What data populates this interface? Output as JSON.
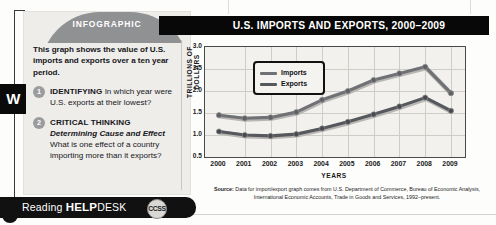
{
  "left_tab": {
    "label": "W"
  },
  "card": {
    "banner": "INFOGRAPHIC",
    "lede": "This graph shows the value of U.S. imports and exports over a ten year period.",
    "questions": [
      {
        "number": "1",
        "term": "IDENTIFYING",
        "text": "In which year were U.S. exports at their lowest?"
      },
      {
        "number": "2",
        "term": "CRITICAL THINKING",
        "subterm": "Determining Cause and Effect",
        "text": "What is one effect of a country importing more than it exports?"
      }
    ]
  },
  "title_bar": {
    "title": "U.S. IMPORTS AND EXPORTS, 2000–2009"
  },
  "source": {
    "label": "Source:",
    "text": "Data for import/export graph comes from U.S. Department of Commerce, Bureau of Economic Analysis, International Economic Accounts, Trade in Goods and Services, 1992–present."
  },
  "help_desk": {
    "word1": "Reading",
    "word2": "HELP",
    "word3": "DESK",
    "badge": "CCSS"
  },
  "colors": {
    "imports_line": "#6f7174",
    "exports_line": "#55585c",
    "title_bar": "#080808",
    "card_bg": "#eeedea",
    "hump": "#8f9193",
    "plot_bg": "#f2f1ee",
    "grid": "#cfcdc8"
  },
  "chart_data": {
    "type": "line",
    "title": "U.S. IMPORTS AND EXPORTS, 2000–2009",
    "xlabel": "YEARS",
    "ylabel": "TRILLIONS OF DOLLARS",
    "categories": [
      "2000",
      "2001",
      "2002",
      "2003",
      "2004",
      "2005",
      "2006",
      "2007",
      "2008",
      "2009"
    ],
    "ylim": [
      0.5,
      3.0
    ],
    "yticks": [
      "3.0",
      "2.5",
      "2.0",
      "1.5",
      "1.0",
      "0.5"
    ],
    "grid": true,
    "legend_position": "top-left",
    "series": [
      {
        "name": "Imports",
        "color": "#6f7174",
        "values": [
          1.45,
          1.38,
          1.4,
          1.52,
          1.8,
          2.0,
          2.25,
          2.4,
          2.55,
          1.95
        ]
      },
      {
        "name": "Exports",
        "color": "#55585c",
        "values": [
          1.08,
          1.0,
          0.98,
          1.02,
          1.15,
          1.3,
          1.47,
          1.65,
          1.85,
          1.55
        ]
      }
    ]
  }
}
